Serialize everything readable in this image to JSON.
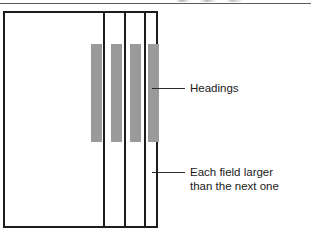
{
  "figure": {
    "background_color": "#ffffff",
    "line_color": "#1c1c1c",
    "bar_color": "#9a9a9a",
    "text_color": "#1a1a1a",
    "width": 311,
    "height": 236
  },
  "record_box": {
    "x": 3,
    "y": 11,
    "width": 155,
    "height": 217,
    "dividers_x": [
      98,
      119,
      139
    ]
  },
  "heading_bars": [
    {
      "x": 86,
      "y": 31,
      "width": 11,
      "height": 98
    },
    {
      "x": 106,
      "y": 31,
      "width": 11,
      "height": 98
    },
    {
      "x": 125,
      "y": 31,
      "width": 11,
      "height": 98
    },
    {
      "x": 143,
      "y": 31,
      "width": 11,
      "height": 98
    }
  ],
  "callouts": [
    {
      "id": "headings",
      "label": "Headings",
      "leader": {
        "x": 152,
        "y": 88,
        "length": 33
      },
      "label_x": 190,
      "label_y": 81
    },
    {
      "id": "field-size",
      "label_line1": "Each field larger",
      "label_line2": "than the next one",
      "leader": {
        "x": 152,
        "y": 172,
        "length": 33
      },
      "label_x": 190,
      "label_y": 165
    }
  ]
}
